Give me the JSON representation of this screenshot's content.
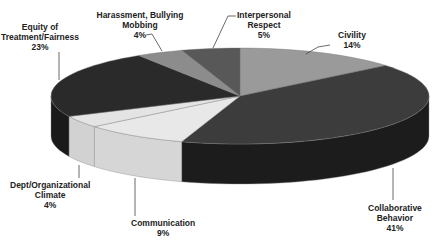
{
  "chart_data": {
    "type": "pie",
    "style": "3d-exploded-none",
    "title": "",
    "start_angle_deg": 0,
    "direction": "clockwise",
    "categories": [
      "Civility",
      "Collaborative Behavior",
      "Communication",
      "Dept/Organizational Climate",
      "Equity of Treatment/Fairness",
      "Harassment, Bullying Mobbing",
      "Interpersonal Respect"
    ],
    "values": [
      14,
      41,
      9,
      4,
      23,
      4,
      5
    ],
    "unit": "%",
    "colors_top": [
      "#9a9a9a",
      "#3c3c3c",
      "#e8e8e8",
      "#e4e4e4",
      "#2a2a2a",
      "#8c8c8c",
      "#585858"
    ],
    "colors_side": [
      "#7a7a7a",
      "#1c1c1c",
      "#d6d6d6",
      "#d2d2d2",
      "#1a1a1a",
      "#6e6e6e",
      "#3c3c3c"
    ],
    "legend": "none (data labels with leader lines)",
    "labels": [
      {
        "lines": [
          "Civility",
          "14%"
        ],
        "x": 352,
        "y": 30,
        "line": [
          [
            306,
            54
          ],
          [
            318,
            47
          ],
          [
            330,
            45
          ]
        ]
      },
      {
        "lines": [
          "Collaborative",
          "Behavior",
          "41%"
        ],
        "x": 395,
        "y": 203,
        "line": [
          [
            393,
            168
          ],
          [
            393,
            200
          ]
        ]
      },
      {
        "lines": [
          "Communication",
          "9%"
        ],
        "x": 163,
        "y": 218,
        "line": [
          [
            135,
            178
          ],
          [
            135,
            216
          ]
        ]
      },
      {
        "lines": [
          "Dept/Organizational",
          "Climate",
          "4%"
        ],
        "x": 50,
        "y": 180,
        "line": [
          [
            79,
            165
          ],
          [
            79,
            178
          ]
        ]
      },
      {
        "lines": [
          "Equity of",
          "Treatment/Fairness",
          "23%"
        ],
        "x": 40,
        "y": 22,
        "line": [
          [
            59,
            52
          ],
          [
            59,
            80
          ]
        ]
      },
      {
        "lines": [
          "Harassment, Bullying",
          "Mobbing",
          "4%"
        ],
        "x": 140,
        "y": 10,
        "line": [
          [
            146,
            35
          ],
          [
            152,
            34
          ],
          [
            162,
            51
          ]
        ]
      },
      {
        "lines": [
          "Interpersonal",
          "Respect",
          "5%"
        ],
        "x": 264,
        "y": 10,
        "line": [
          [
            236,
            16
          ],
          [
            228,
            16
          ],
          [
            213,
            48
          ]
        ]
      }
    ]
  },
  "geometry": {
    "cx": 240,
    "cy": 96,
    "rx": 189,
    "ry": 48,
    "depth": 40
  }
}
